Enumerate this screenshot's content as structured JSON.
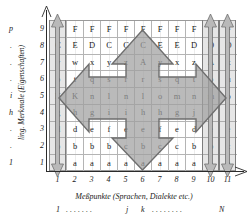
{
  "figure": {
    "y_axis_caption": "ling. Merkmale (Eigenschaften)",
    "x_axis_caption": "Meßpunkte (Sprachen, Dialekte etc.)"
  },
  "axes": {
    "row_numbers": [
      "9",
      "8",
      "7",
      "6",
      "5",
      "4",
      "3",
      "2",
      "1"
    ],
    "column_numbers": [
      "1",
      "2",
      "3",
      "4",
      "5",
      "6",
      "7",
      "8",
      "9",
      "10",
      "11"
    ],
    "outer_row_index": [
      "p",
      ".",
      ".",
      ".",
      "i",
      "h",
      ".",
      ".",
      "1"
    ],
    "bottom_index": {
      "start": "1",
      "dots_left": ". . . . . . .",
      "j": "j",
      "k": "k",
      "dots_right": ". . . . . . . .",
      "end": "N"
    }
  },
  "grid": {
    "rows": [
      [
        "F",
        "F",
        "F",
        "F",
        "F",
        "F",
        "F",
        "F",
        "F",
        "F",
        "F"
      ],
      [
        "C",
        "E",
        "D",
        "C",
        "C",
        "C",
        "E",
        "E",
        "D",
        "D",
        "D"
      ],
      [
        "v",
        "w",
        "x",
        "y",
        "z",
        "A",
        "y",
        "x",
        "z",
        "A",
        "x"
      ],
      [
        "p",
        "t",
        "q",
        "s",
        "r",
        "r",
        "s",
        "q",
        "t",
        "p",
        "u"
      ],
      [
        "K",
        "K",
        "n",
        "l",
        "n",
        "l",
        "o",
        "m",
        "n",
        "m",
        "o"
      ],
      [
        "g",
        "h",
        "g",
        "i",
        "i",
        "h",
        "h",
        "g",
        "j",
        "j",
        "j"
      ],
      [
        "d",
        "d",
        "e",
        "f",
        "e",
        "e",
        "f",
        "e",
        "d",
        "e",
        "e"
      ],
      [
        "b",
        "b",
        "b",
        "b",
        "c",
        "b",
        "c",
        "c",
        "b",
        "b",
        "c"
      ],
      [
        "a",
        "a",
        "a",
        "a",
        "a",
        "a",
        "a",
        "a",
        "a",
        "a",
        "a"
      ]
    ]
  },
  "highlight": {
    "shaded_columns": [
      1,
      10,
      11
    ],
    "shaded_region_columns": [
      5,
      6,
      7
    ],
    "shaded_region_rows_top": 7,
    "shaded_region_rows_bottom": 3
  },
  "colors": {
    "arrow_fill": "#a8a8a8",
    "arrow_stroke": "#6e6e6e",
    "band_fill": "#c0c0c0",
    "grid_line": "#b4b4b4",
    "axis": "#2b2b2b"
  }
}
